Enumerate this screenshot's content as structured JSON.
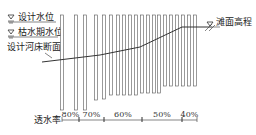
{
  "labels": {
    "design_water_level": "设计水位",
    "dry_season_water_level": "枯水期水位",
    "design_riverbed_section": "设计河床断面",
    "beach_elevation": "滩面高程",
    "permeability": "透水率"
  },
  "zones": [
    {
      "label": "80%",
      "x1": 62,
      "x2": 79
    },
    {
      "label": "70%",
      "x1": 79,
      "x2": 104
    },
    {
      "label": "60%",
      "x1": 104,
      "x2": 142
    },
    {
      "label": "50%",
      "x1": 142,
      "x2": 182
    },
    {
      "label": "40%",
      "x1": 182,
      "x2": 197
    }
  ],
  "piles": [
    {
      "x": 62,
      "bottom": 110
    },
    {
      "x": 76,
      "bottom": 110
    },
    {
      "x": 85,
      "bottom": 110
    },
    {
      "x": 96,
      "bottom": 100
    },
    {
      "x": 104,
      "bottom": 99
    },
    {
      "x": 111,
      "bottom": 95
    },
    {
      "x": 118,
      "bottom": 95
    },
    {
      "x": 124,
      "bottom": 95
    },
    {
      "x": 130,
      "bottom": 95
    },
    {
      "x": 136,
      "bottom": 95
    },
    {
      "x": 142,
      "bottom": 93
    },
    {
      "x": 148,
      "bottom": 93
    },
    {
      "x": 154,
      "bottom": 93
    },
    {
      "x": 159,
      "bottom": 93
    },
    {
      "x": 165,
      "bottom": 86
    },
    {
      "x": 171,
      "bottom": 86
    },
    {
      "x": 177,
      "bottom": 86
    },
    {
      "x": 183,
      "bottom": 86
    },
    {
      "x": 189,
      "bottom": 86
    },
    {
      "x": 195,
      "bottom": 86
    }
  ],
  "colors": {
    "line": "#333333",
    "pile_stroke": "#555555"
  }
}
